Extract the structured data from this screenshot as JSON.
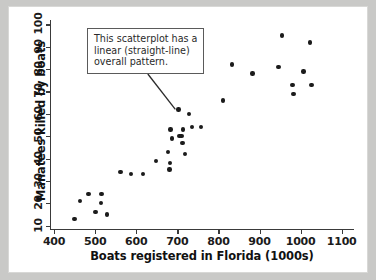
{
  "annotation": {
    "line1": "This scatterplot has a",
    "line2": "linear (straight-line)",
    "line3": "overall pattern."
  },
  "chart_data": {
    "type": "scatter",
    "title": "",
    "xlabel": "Boats registered in Florida (1000s)",
    "ylabel": "Manatees killed by boats",
    "xlim": [
      390,
      1130
    ],
    "ylim": [
      8,
      102
    ],
    "xticks": [
      400,
      500,
      600,
      700,
      800,
      900,
      1000,
      1100
    ],
    "yticks": [
      10,
      20,
      30,
      40,
      50,
      60,
      70,
      80,
      90,
      100
    ],
    "grid": false,
    "legend": "none",
    "marker": "filled-circle",
    "marker_color": "#1b1b1b",
    "points": [
      {
        "x": 447,
        "y": 13
      },
      {
        "x": 460,
        "y": 21
      },
      {
        "x": 481,
        "y": 24
      },
      {
        "x": 498,
        "y": 16
      },
      {
        "x": 513,
        "y": 24
      },
      {
        "x": 512,
        "y": 20
      },
      {
        "x": 526,
        "y": 15
      },
      {
        "x": 559,
        "y": 34
      },
      {
        "x": 585,
        "y": 33
      },
      {
        "x": 614,
        "y": 33
      },
      {
        "x": 645,
        "y": 39
      },
      {
        "x": 675,
        "y": 43
      },
      {
        "x": 679,
        "y": 38
      },
      {
        "x": 678,
        "y": 35
      },
      {
        "x": 684,
        "y": 49
      },
      {
        "x": 681,
        "y": 53
      },
      {
        "x": 703,
        "y": 50
      },
      {
        "x": 708,
        "y": 50
      },
      {
        "x": 710,
        "y": 47
      },
      {
        "x": 712,
        "y": 53
      },
      {
        "x": 716,
        "y": 42
      },
      {
        "x": 700,
        "y": 62
      },
      {
        "x": 726,
        "y": 60
      },
      {
        "x": 733,
        "y": 54
      },
      {
        "x": 755,
        "y": 54
      },
      {
        "x": 809,
        "y": 66
      },
      {
        "x": 830,
        "y": 82
      },
      {
        "x": 880,
        "y": 78
      },
      {
        "x": 944,
        "y": 81
      },
      {
        "x": 952,
        "y": 95
      },
      {
        "x": 978,
        "y": 73
      },
      {
        "x": 980,
        "y": 69
      },
      {
        "x": 1005,
        "y": 79
      },
      {
        "x": 1021,
        "y": 92
      },
      {
        "x": 1024,
        "y": 73
      }
    ],
    "annotation_target": {
      "x": 700,
      "y": 62
    }
  }
}
